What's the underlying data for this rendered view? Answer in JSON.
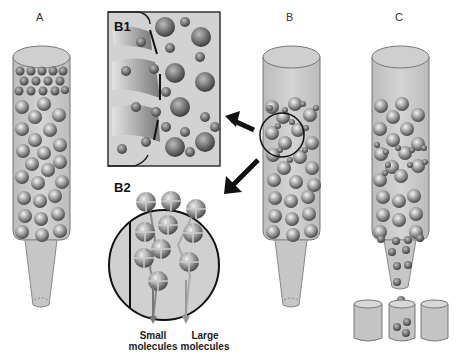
{
  "figure": {
    "panels": {
      "A": {
        "label": "A"
      },
      "B": {
        "label": "B"
      },
      "C": {
        "label": "C"
      },
      "B1": {
        "label": "B1"
      },
      "B2": {
        "label": "B2"
      }
    },
    "legend": {
      "small": {
        "line1": "Small",
        "line2": "molecules"
      },
      "large": {
        "line1": "Large",
        "line2": "molecules"
      }
    },
    "colors": {
      "column_fill": "#c8c8c8",
      "column_stroke": "#777777",
      "bead_dark": "#555555",
      "bead_light": "#eeeeee",
      "inset_fill": "#d0d0d0",
      "arrow": "#111111",
      "small_path": "#777777",
      "large_path": "#999999"
    }
  }
}
